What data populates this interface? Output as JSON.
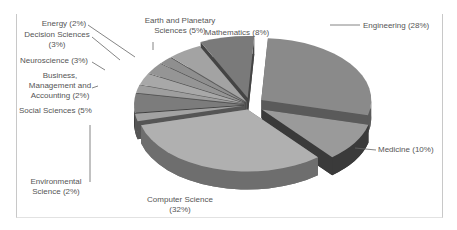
{
  "chart_data": {
    "type": "pie",
    "style": "3d-exploded",
    "title": "",
    "slices": [
      {
        "label": "Engineering",
        "value": 28,
        "display": "Engineering (28%)"
      },
      {
        "label": "Medicine",
        "value": 10,
        "display": "Medicine (10%)"
      },
      {
        "label": "Computer Science",
        "value": 32,
        "display": [
          "Computer Science",
          "(32%)"
        ]
      },
      {
        "label": "Environmental Science",
        "value": 2,
        "display": [
          "Environmental",
          "Science (2%)"
        ]
      },
      {
        "label": "Social Sciences",
        "value": 5,
        "display": [
          "Social Sciences (5%"
        ]
      },
      {
        "label": "Business, Management and Accounting",
        "value": 2,
        "display": [
          "Business,",
          "Management and",
          "Accounting (2%)"
        ]
      },
      {
        "label": "Neuroscience",
        "value": 3,
        "display": [
          "Neuroscience (3%)"
        ]
      },
      {
        "label": "Decision Sciences",
        "value": 3,
        "display": [
          "Decision Sciences",
          "(3%)"
        ]
      },
      {
        "label": "Energy",
        "value": 2,
        "display": [
          "Energy (2%)"
        ]
      },
      {
        "label": "Earth and Planetary Sciences",
        "value": 5,
        "display": [
          "Earth and Planetary",
          "Sciences (5%)"
        ]
      },
      {
        "label": "Mathematics",
        "value": 8,
        "display": [
          "Mathematics (8%)"
        ]
      }
    ],
    "legend": "none",
    "colors": {
      "top_light": "#a9a9a9",
      "top_mid": "#8c8c8c",
      "top_dark": "#6f6f6f",
      "side_dark": "#3d3d3d",
      "label_text": "#555555"
    }
  }
}
